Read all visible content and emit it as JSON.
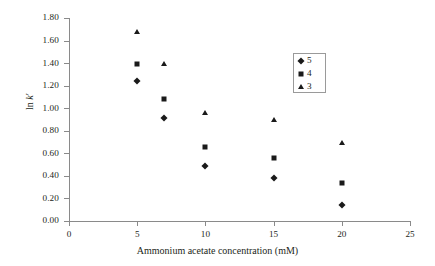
{
  "chart_data": {
    "type": "scatter",
    "title": "",
    "xlabel": "Ammonium acetate concentration (mM)",
    "ylabel": "ln k'",
    "xlim": [
      0,
      25
    ],
    "ylim": [
      0.0,
      1.8
    ],
    "xticks": [
      0,
      5,
      10,
      15,
      20,
      25
    ],
    "xtick_labels": [
      "0",
      "5",
      "10",
      "15",
      "20",
      "25"
    ],
    "yticks": [
      0.0,
      0.2,
      0.4,
      0.6,
      0.8,
      1.0,
      1.2,
      1.4,
      1.6,
      1.8
    ],
    "ytick_labels": [
      "0.00",
      "0.20",
      "0.40",
      "0.60",
      "0.80",
      "1.00",
      "1.20",
      "1.40",
      "1.60",
      "1.80"
    ],
    "grid": false,
    "legend_position": "upper-right",
    "marker_color": "#1a1a1a",
    "axis_color": "#8a8a8a",
    "x": [
      5,
      7,
      10,
      15,
      20
    ],
    "series": [
      {
        "name": "5",
        "marker": "diamond",
        "values": [
          1.24,
          0.91,
          0.49,
          0.38,
          0.14
        ]
      },
      {
        "name": "4",
        "marker": "square",
        "values": [
          1.39,
          1.08,
          0.66,
          0.56,
          0.34
        ]
      },
      {
        "name": "3",
        "marker": "triangle",
        "values": [
          1.68,
          1.39,
          0.96,
          0.9,
          0.69
        ]
      }
    ],
    "legend": [
      {
        "label": "5",
        "marker": "diamond"
      },
      {
        "label": "4",
        "marker": "square"
      },
      {
        "label": "3",
        "marker": "triangle"
      }
    ]
  },
  "axis_titles": {
    "x": "Ammonium acetate concentration (mM)",
    "y_prefix": "ln ",
    "y_italic": "k",
    "y_suffix": "′"
  }
}
